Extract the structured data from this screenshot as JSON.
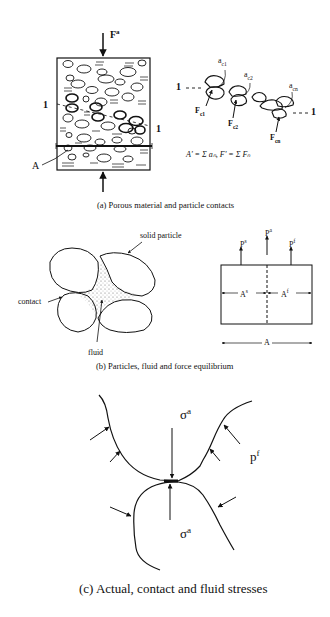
{
  "panel_a": {
    "force_top": "F",
    "force_top_sup": "a",
    "section_label_left": "1",
    "section_label_right": "1",
    "area_label": "A",
    "chain": {
      "left_label": "1",
      "right_label": "1",
      "contact_areas": [
        "a",
        "a",
        "a"
      ],
      "contact_area_subs": [
        "c1",
        "c2",
        "cn"
      ],
      "contact_forces": [
        "F",
        "F",
        "F"
      ],
      "contact_force_subs": [
        "c1",
        "c2",
        "cn"
      ]
    },
    "equation": "A' = Σ aₙ,   F' = Σ Fₙ",
    "caption": "(a) Porous material and particle contacts"
  },
  "panel_b": {
    "labels": {
      "solid_particle": "solid particle",
      "contact": "contact",
      "fluid": "fluid"
    },
    "forces": [
      {
        "symbol": "P",
        "sup": "s"
      },
      {
        "symbol": "P",
        "sup": "a"
      },
      {
        "symbol": "P",
        "sup": "f"
      }
    ],
    "areas": {
      "solid": "A",
      "solid_sup": "s",
      "fluid": "A",
      "fluid_sup": "f",
      "total": "A"
    },
    "caption": "(b) Particles, fluid and force equilibrium"
  },
  "panel_c": {
    "stress_upper": "σ",
    "stress_upper_sup": "a",
    "stress_lower": "σ",
    "stress_lower_sup": "a",
    "fluid_pressure": "p",
    "fluid_pressure_sup": "f",
    "caption": "(c) Actual, contact and fluid stresses"
  }
}
